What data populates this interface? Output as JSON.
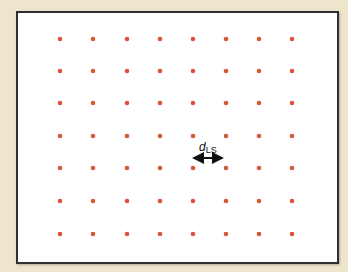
{
  "diagram": {
    "title": "",
    "lattice": {
      "columns_x": [
        60,
        93,
        127,
        160,
        193,
        226,
        259,
        292
      ],
      "rows_y": [
        39,
        71,
        103,
        136,
        168,
        201,
        234
      ],
      "dot_color": "#d9553a",
      "dot_radius": 2.3
    },
    "spacing_label": {
      "symbol": "d",
      "subscript": "LS"
    },
    "arrow": {
      "x1": 191,
      "x2": 225,
      "y": 158,
      "color": "#111111"
    },
    "colors": {
      "background": "#eee5cd",
      "frame_fill": "#ffffff",
      "frame_border": "#2f2f2f"
    }
  }
}
